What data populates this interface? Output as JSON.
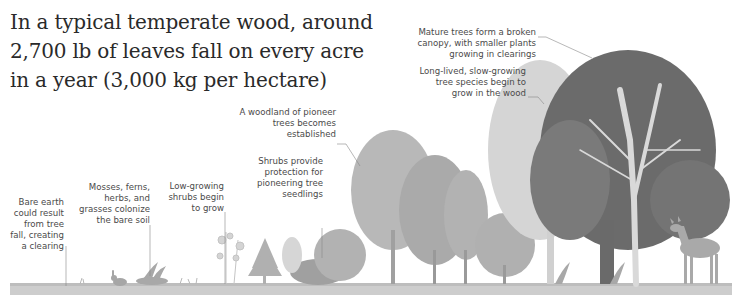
{
  "title": {
    "lines": [
      "In a typical temperate wood, around",
      "2,700 lb of leaves fall on every acre",
      "in a year (3,000 kg per hectare)"
    ]
  },
  "stages": [
    {
      "id": "bare-earth",
      "lines": [
        "Bare earth",
        "could result",
        "from tree",
        "fall, creating",
        "a clearing"
      ]
    },
    {
      "id": "mosses",
      "lines": [
        "Mosses, ferns,",
        "herbs, and",
        "grasses colonize",
        "the bare soil"
      ]
    },
    {
      "id": "low-shrubs",
      "lines": [
        "Low-growing",
        "shrubs begin",
        "to grow"
      ]
    },
    {
      "id": "shrubs-protection",
      "lines": [
        "Shrubs provide",
        "protection for",
        "pioneering tree",
        "seedlings"
      ]
    },
    {
      "id": "pioneer-woodland",
      "lines": [
        "A woodland of pioneer",
        "trees becomes",
        "established"
      ]
    },
    {
      "id": "slow-growing",
      "lines": [
        "Long-lived, slow-growing",
        "tree species begin to",
        "grow in the wood"
      ]
    },
    {
      "id": "mature-canopy",
      "lines": [
        "Mature trees form a broken",
        "canopy, with smaller plants",
        "growing in clearings"
      ]
    }
  ],
  "colors": {
    "text": "#2a2a2a",
    "label": "#4a4a4a",
    "leader": "#888888",
    "ground": "#c9c9c9",
    "light": "#d2d2d2",
    "mid": "#a9a9a9",
    "dark": "#6e6e6e",
    "darkest": "#555555"
  }
}
